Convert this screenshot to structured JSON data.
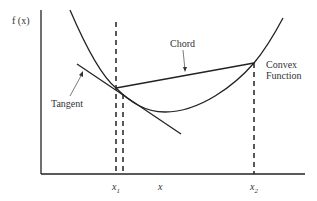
{
  "diagram": {
    "y_axis_label": "f (x)",
    "x_tick_labels": [
      {
        "id": "x1",
        "text": "x",
        "sub": "1"
      },
      {
        "id": "x",
        "text": "x",
        "sub": ""
      },
      {
        "id": "x2",
        "text": "x",
        "sub": "2"
      }
    ],
    "annotations": {
      "chord": "Chord",
      "convex_function_line1": "Convex",
      "convex_function_line2": "Function",
      "tangent": "Tangent"
    },
    "elements": [
      "convex curve",
      "chord between x1 and x2",
      "tangent at x1",
      "dashed verticals at x1, x, x2"
    ],
    "colors": {
      "stroke": "#222222",
      "text": "#333333",
      "background": "#ffffff"
    }
  }
}
